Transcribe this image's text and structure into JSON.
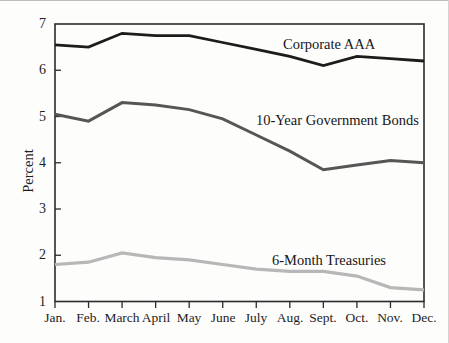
{
  "figure": {
    "background": "#fdfdfc"
  },
  "chart_data": {
    "type": "line",
    "title": "",
    "xlabel": "",
    "ylabel": "Percent",
    "ylim": [
      1,
      7
    ],
    "grid": false,
    "legend_position": "inline-labels-on-lines",
    "axis_color": "#2b2b2b",
    "categories": [
      "Jan.",
      "Feb.",
      "March",
      "April",
      "May",
      "June",
      "July",
      "Aug.",
      "Sept.",
      "Oct.",
      "Nov.",
      "Dec."
    ],
    "y_ticks": [
      "7",
      "6",
      "5",
      "4",
      "3",
      "2",
      "1"
    ],
    "series": [
      {
        "name": "Corporate AAA",
        "color": "#1c1c1c",
        "line_width": 2.8,
        "values": [
          6.55,
          6.5,
          6.8,
          6.75,
          6.75,
          6.6,
          6.45,
          6.3,
          6.1,
          6.3,
          6.25,
          6.2
        ]
      },
      {
        "name": "10-Year Government Bonds",
        "color": "#565656",
        "line_width": 3,
        "values": [
          5.05,
          4.9,
          5.3,
          5.25,
          5.15,
          4.95,
          4.6,
          4.25,
          3.85,
          3.95,
          4.05,
          4.0
        ]
      },
      {
        "name": "6-Month Treasuries",
        "color": "#b7b7b7",
        "line_width": 3.2,
        "values": [
          1.8,
          1.85,
          2.05,
          1.95,
          1.9,
          1.8,
          1.7,
          1.65,
          1.65,
          1.55,
          1.3,
          1.25
        ]
      }
    ]
  }
}
